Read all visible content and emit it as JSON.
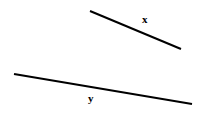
{
  "figure": {
    "width": 199,
    "height": 119,
    "background_color": "#ffffff",
    "stroke_color": "#000000",
    "stroke_width": 2
  },
  "segments": [
    {
      "id": "x",
      "label": "x",
      "label_position": "above-right",
      "x1": 90,
      "y1": 11,
      "x2": 181,
      "y2": 49,
      "label_x": 142,
      "label_y": 14
    },
    {
      "id": "y",
      "label": "y",
      "label_position": "below-middle",
      "x1": 14,
      "y1": 74,
      "x2": 192,
      "y2": 104,
      "label_x": 88,
      "label_y": 93
    }
  ]
}
